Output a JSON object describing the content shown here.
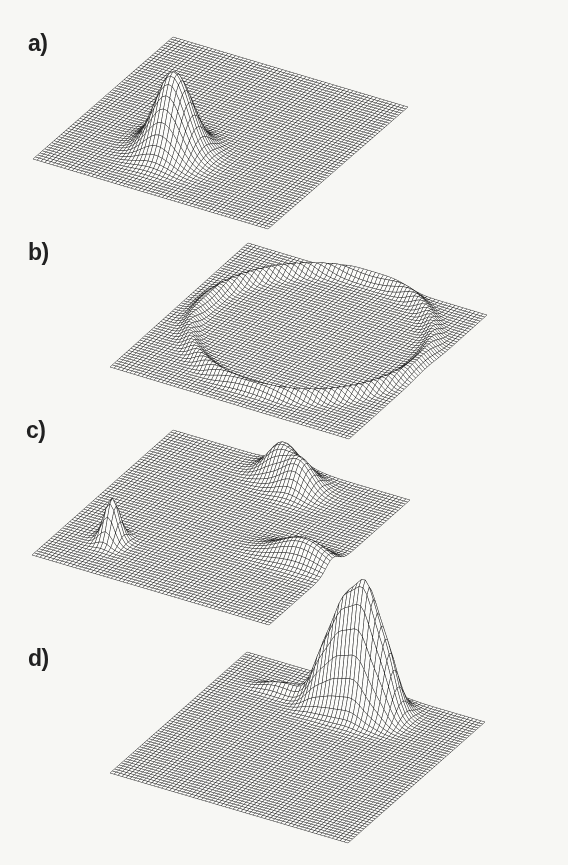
{
  "style": {
    "background": "#f7f7f4",
    "mesh_ink": "#1c1c1c",
    "mesh_fill": "#fcfcfa",
    "label_color": "#212121"
  },
  "figure": {
    "kind": "four stacked 3D hidden-line wireframe surface plots on scanned paper",
    "panel_labels": [
      "a)",
      "b)",
      "c)",
      "d)"
    ]
  },
  "chart_data": [
    {
      "panel": "a",
      "label": "a)",
      "type": "surface",
      "render": "hidden-line wireframe mesh, oblique parallelogram projection",
      "description": "Flat square mesh sheet with one tall narrow Gaussian peak left of centre toward the front, with a tiny secondary wrinkle on its left flank.",
      "grid_n": 60,
      "projection": {
        "origin": [
          173,
          37
        ],
        "u": [
          235,
          70
        ],
        "v": [
          -140,
          122
        ]
      },
      "features": [
        {
          "shape": "gaussian-peak",
          "center": [
            0.42,
            0.7
          ],
          "sigma": [
            0.07,
            0.07
          ],
          "height_px": 80
        },
        {
          "shape": "gaussian-peak",
          "center": [
            0.31,
            0.63
          ],
          "sigma": [
            0.035,
            0.04
          ],
          "height_px": 10
        }
      ]
    },
    {
      "panel": "b",
      "label": "b)",
      "type": "surface",
      "render": "hidden-line wireframe mesh, oblique parallelogram projection",
      "description": "Flat square mesh sheet with a large shallow circular crater-rim (ring-shaped ridge) almost spanning the whole sheet; interior flat at base level.",
      "grid_n": 60,
      "projection": {
        "origin": [
          248,
          243
        ],
        "u": [
          239,
          72
        ],
        "v": [
          -138,
          124
        ]
      },
      "features": [
        {
          "shape": "ring-ridge",
          "center": [
            0.52,
            0.44
          ],
          "radius": 0.44,
          "sigma": 0.022,
          "height_px": 9
        }
      ]
    },
    {
      "panel": "c",
      "label": "c)",
      "type": "surface",
      "render": "hidden-line wireframe mesh, oblique parallelogram projection",
      "description": "Flat square mesh sheet with three separated low features: a double hump on the back edge right of centre, a sharp narrow spike near the left corner, and an elongated bump along the front-right edge.",
      "grid_n": 60,
      "projection": {
        "origin": [
          173,
          430
        ],
        "u": [
          237,
          70
        ],
        "v": [
          -141,
          125
        ]
      },
      "features": [
        {
          "shape": "gaussian-peak",
          "center": [
            0.5,
            0.07
          ],
          "sigma": [
            0.055,
            0.05
          ],
          "height_px": 30
        },
        {
          "shape": "gaussian-peak",
          "center": [
            0.61,
            0.13
          ],
          "sigma": [
            0.055,
            0.05
          ],
          "height_px": 28
        },
        {
          "shape": "gaussian-peak",
          "center": [
            0.2,
            0.77
          ],
          "sigma": [
            0.028,
            0.032
          ],
          "height_px": 42
        },
        {
          "shape": "gaussian-peak",
          "center": [
            0.88,
            0.55
          ],
          "sigma": [
            0.1,
            0.045
          ],
          "height_px": 22
        }
      ]
    },
    {
      "panel": "d",
      "label": "d)",
      "type": "surface",
      "render": "hidden-line wireframe mesh, oblique parallelogram projection",
      "description": "Flat square mesh sheet with a tall multi-lobed peak massif just behind the back edge, right of centre, its fins rising above the sheet, plus a faint low ridge trailing to the back-left.",
      "grid_n": 60,
      "projection": {
        "origin": [
          247,
          652
        ],
        "u": [
          238,
          70
        ],
        "v": [
          -137,
          121
        ]
      },
      "features": [
        {
          "shape": "gaussian-peak",
          "center": [
            0.42,
            0.165
          ],
          "sigma": [
            0.042,
            0.05
          ],
          "height_px": 48
        },
        {
          "shape": "gaussian-peak",
          "center": [
            0.5,
            0.158
          ],
          "sigma": [
            0.042,
            0.05
          ],
          "height_px": 88
        },
        {
          "shape": "gaussian-peak",
          "center": [
            0.585,
            0.15
          ],
          "sigma": [
            0.044,
            0.055
          ],
          "height_px": 112
        },
        {
          "shape": "gaussian-peak",
          "center": [
            0.67,
            0.145
          ],
          "sigma": [
            0.042,
            0.05
          ],
          "height_px": 58
        },
        {
          "shape": "gaussian-peak",
          "center": [
            0.22,
            0.19
          ],
          "sigma": [
            0.05,
            0.022
          ],
          "height_px": 6
        },
        {
          "shape": "gaussian-peak",
          "center": [
            0.3,
            0.175
          ],
          "sigma": [
            0.05,
            0.022
          ],
          "height_px": 8
        }
      ]
    }
  ]
}
